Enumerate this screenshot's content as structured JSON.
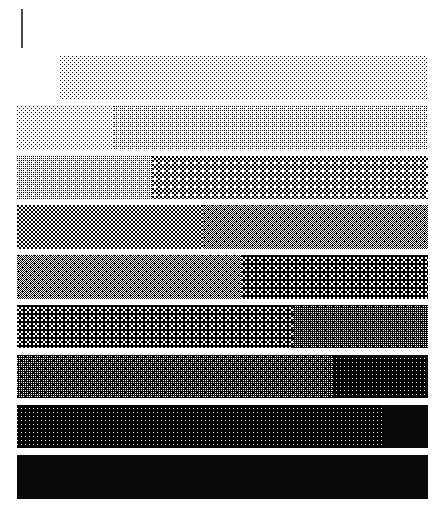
{
  "document": {
    "title": "Halftone Grayscale Step Wedge",
    "background_color": "#ffffff",
    "width": 442,
    "height": 519
  },
  "tick_rule": {
    "name": "vertical-rule",
    "color": "#4a4a4a",
    "x": 21,
    "y": 9,
    "width": 2,
    "height": 39
  },
  "chart_data": {
    "type": "bar",
    "subtitle": "",
    "xlabel": "",
    "ylabel": "",
    "grid": false,
    "legend": false,
    "orientation": "horizontal",
    "axis_x_range": [
      0,
      442
    ],
    "axis_y_range": [
      0,
      519
    ],
    "categories": [
      "step-1",
      "step-2",
      "step-3",
      "step-4",
      "step-5",
      "step-6",
      "step-7",
      "step-8",
      "step-9"
    ],
    "bars": [
      {
        "index": 1,
        "x": 60,
        "y": 56,
        "width": 368,
        "height": 44,
        "split_x": 60,
        "split_fraction": 0.0,
        "segments": [
          {
            "name": "right",
            "tone": 0.1,
            "gray_hex": "#e8e8e8",
            "pattern": "dot",
            "dot_size": 1,
            "cell": 3,
            "width_px": 368
          }
        ]
      },
      {
        "index": 2,
        "x": 17,
        "y": 106,
        "width": 411,
        "height": 43,
        "split_x": 114,
        "split_fraction": 0.236,
        "segments": [
          {
            "name": "left",
            "tone": 0.09,
            "gray_hex": "#ebebeb",
            "pattern": "dot",
            "dot_size": 1,
            "cell": 3,
            "width_px": 97
          },
          {
            "name": "right",
            "tone": 0.2,
            "gray_hex": "#d2d2d2",
            "pattern": "weave",
            "dot_size": 1,
            "cell": 2,
            "width_px": 314
          }
        ]
      },
      {
        "index": 3,
        "x": 17,
        "y": 156,
        "width": 411,
        "height": 43,
        "split_x": 152,
        "split_fraction": 0.329,
        "segments": [
          {
            "name": "left",
            "tone": 0.22,
            "gray_hex": "#cfcfcf",
            "pattern": "weave",
            "dot_size": 1,
            "cell": 2,
            "width_px": 135
          },
          {
            "name": "right",
            "tone": 0.42,
            "gray_hex": "#9c9c9c",
            "pattern": "checker",
            "dot_size": 2,
            "cell": 4,
            "width_px": 276
          }
        ]
      },
      {
        "index": 4,
        "x": 17,
        "y": 205,
        "width": 411,
        "height": 44,
        "split_x": 203,
        "split_fraction": 0.453,
        "segments": [
          {
            "name": "left",
            "tone": 0.44,
            "gray_hex": "#989898",
            "pattern": "checker",
            "dot_size": 2,
            "cell": 4,
            "width_px": 186
          },
          {
            "name": "right",
            "tone": 0.52,
            "gray_hex": "#838383",
            "pattern": "fine-dot",
            "dot_size": 1,
            "cell": 2,
            "width_px": 225
          }
        ]
      },
      {
        "index": 5,
        "x": 17,
        "y": 255,
        "width": 411,
        "height": 44,
        "split_x": 241,
        "split_fraction": 0.545,
        "segments": [
          {
            "name": "left",
            "tone": 0.53,
            "gray_hex": "#828282",
            "pattern": "fine-dot",
            "dot_size": 1,
            "cell": 2,
            "width_px": 224
          },
          {
            "name": "right",
            "tone": 0.64,
            "gray_hex": "#5e5e5e",
            "pattern": "checker",
            "dot_size": 2,
            "cell": 4,
            "width_px": 187
          }
        ]
      },
      {
        "index": 6,
        "x": 17,
        "y": 305,
        "width": 411,
        "height": 43,
        "split_x": 293,
        "split_fraction": 0.672,
        "segments": [
          {
            "name": "left",
            "tone": 0.66,
            "gray_hex": "#5a5a5a",
            "pattern": "checker",
            "dot_size": 2,
            "cell": 4,
            "width_px": 276
          },
          {
            "name": "right",
            "tone": 0.76,
            "gray_hex": "#3d3d3d",
            "pattern": "weave",
            "dot_size": 1,
            "cell": 2,
            "width_px": 135
          }
        ]
      },
      {
        "index": 7,
        "x": 17,
        "y": 355,
        "width": 411,
        "height": 43,
        "split_x": 332,
        "split_fraction": 0.766,
        "segments": [
          {
            "name": "left",
            "tone": 0.77,
            "gray_hex": "#3b3b3b",
            "pattern": "weave",
            "dot_size": 1,
            "cell": 2,
            "width_px": 315
          },
          {
            "name": "right",
            "tone": 0.88,
            "gray_hex": "#1f1f1f",
            "pattern": "dot",
            "dot_size": 1,
            "cell": 3,
            "width_px": 96
          }
        ]
      },
      {
        "index": 8,
        "x": 17,
        "y": 405,
        "width": 411,
        "height": 43,
        "split_x": 383,
        "split_fraction": 0.89,
        "segments": [
          {
            "name": "left",
            "tone": 0.89,
            "gray_hex": "#1d1d1d",
            "pattern": "dot",
            "dot_size": 1,
            "cell": 3,
            "width_px": 366
          },
          {
            "name": "right",
            "tone": 1.0,
            "gray_hex": "#0a0a0a",
            "pattern": "solid",
            "dot_size": 0,
            "cell": 0,
            "width_px": 45
          }
        ]
      },
      {
        "index": 9,
        "x": 17,
        "y": 455,
        "width": 411,
        "height": 44,
        "split_x": 428,
        "split_fraction": 1.0,
        "segments": [
          {
            "name": "left",
            "tone": 1.0,
            "gray_hex": "#090909",
            "pattern": "solid",
            "dot_size": 0,
            "cell": 0,
            "width_px": 411
          }
        ]
      }
    ]
  }
}
